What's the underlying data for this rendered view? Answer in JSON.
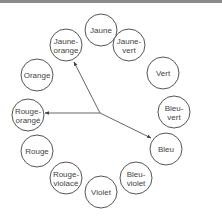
{
  "diagram": {
    "type": "color-wheel-triad",
    "stroke_color": "#555555",
    "center": {
      "x": 100,
      "y": 113
    },
    "radius": 16,
    "colors": [
      {
        "lines": [
          "Jaune"
        ],
        "x": 101,
        "y": 30
      },
      {
        "lines": [
          "Jaune-",
          "vert"
        ],
        "x": 129,
        "y": 45
      },
      {
        "lines": [
          "Vert"
        ],
        "x": 163,
        "y": 73
      },
      {
        "lines": [
          "Bleu-",
          "vert"
        ],
        "x": 174,
        "y": 112
      },
      {
        "lines": [
          "Bleu"
        ],
        "x": 166,
        "y": 149
      },
      {
        "lines": [
          "Bleu-",
          "violet"
        ],
        "x": 136,
        "y": 178
      },
      {
        "lines": [
          "Violet"
        ],
        "x": 101,
        "y": 192
      },
      {
        "lines": [
          "Rouge-",
          "violacé"
        ],
        "x": 66,
        "y": 178
      },
      {
        "lines": [
          "Rouge"
        ],
        "x": 37,
        "y": 151
      },
      {
        "lines": [
          "Rouge-",
          "orangé"
        ],
        "x": 28,
        "y": 115
      },
      {
        "lines": [
          "Orange"
        ],
        "x": 37,
        "y": 75
      },
      {
        "lines": [
          "Jaune-",
          "orange"
        ],
        "x": 66,
        "y": 45
      }
    ],
    "arrows": [
      {
        "to": "Jaune-orange",
        "x": 74,
        "y": 62
      },
      {
        "to": "Rouge-orangé",
        "x": 45,
        "y": 113
      },
      {
        "to": "Bleu",
        "x": 151,
        "y": 138
      }
    ]
  }
}
